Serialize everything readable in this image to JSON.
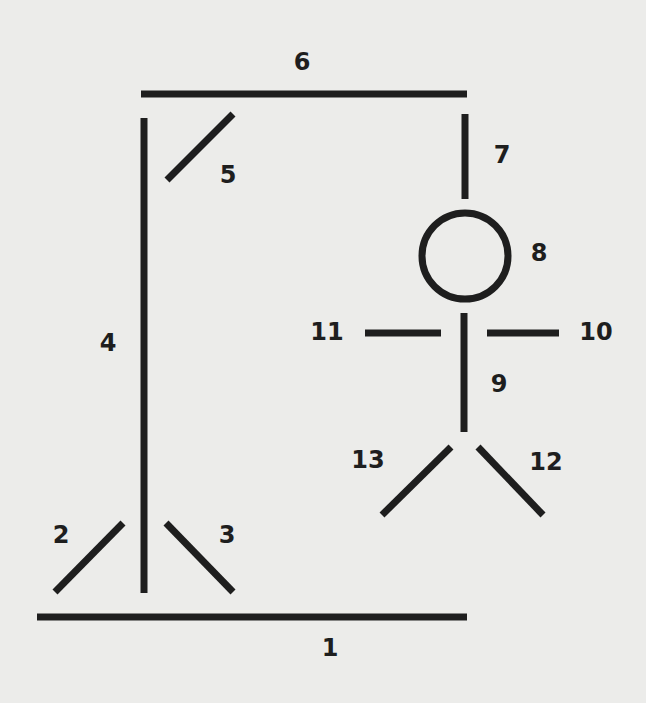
{
  "diagram": {
    "stroke_color": "#1e1e1e",
    "background_color": "#ececea",
    "parts": [
      {
        "id": 1,
        "name": "base",
        "label": "1",
        "shape": "line",
        "x1": 37,
        "y1": 617,
        "x2": 467,
        "y2": 617,
        "label_x": 330,
        "label_y": 648
      },
      {
        "id": 2,
        "name": "left-strut",
        "label": "2",
        "shape": "line",
        "x1": 123,
        "y1": 523,
        "x2": 55,
        "y2": 592,
        "label_x": 61,
        "label_y": 535
      },
      {
        "id": 3,
        "name": "right-strut",
        "label": "3",
        "shape": "line",
        "x1": 166,
        "y1": 523,
        "x2": 233,
        "y2": 592,
        "label_x": 227,
        "label_y": 535
      },
      {
        "id": 4,
        "name": "pole",
        "label": "4",
        "shape": "line",
        "x1": 144,
        "y1": 118,
        "x2": 144,
        "y2": 593,
        "label_x": 108,
        "label_y": 343
      },
      {
        "id": 5,
        "name": "brace",
        "label": "5",
        "shape": "line",
        "x1": 167,
        "y1": 180,
        "x2": 233,
        "y2": 114,
        "label_x": 228,
        "label_y": 175
      },
      {
        "id": 6,
        "name": "beam",
        "label": "6",
        "shape": "line",
        "x1": 141,
        "y1": 94,
        "x2": 467,
        "y2": 94,
        "label_x": 302,
        "label_y": 62
      },
      {
        "id": 7,
        "name": "rope",
        "label": "7",
        "shape": "line",
        "x1": 465,
        "y1": 114,
        "x2": 465,
        "y2": 199,
        "label_x": 502,
        "label_y": 155
      },
      {
        "id": 8,
        "name": "head",
        "label": "8",
        "shape": "circle",
        "cx": 465,
        "cy": 256,
        "r": 43,
        "label_x": 539,
        "label_y": 253
      },
      {
        "id": 9,
        "name": "body",
        "label": "9",
        "shape": "line",
        "x1": 464,
        "y1": 313,
        "x2": 464,
        "y2": 432,
        "label_x": 499,
        "label_y": 384
      },
      {
        "id": 10,
        "name": "right-arm",
        "label": "10",
        "shape": "line",
        "x1": 487,
        "y1": 333,
        "x2": 559,
        "y2": 333,
        "label_x": 596,
        "label_y": 332
      },
      {
        "id": 11,
        "name": "left-arm",
        "label": "11",
        "shape": "line",
        "x1": 365,
        "y1": 333,
        "x2": 441,
        "y2": 333,
        "label_x": 327,
        "label_y": 332
      },
      {
        "id": 12,
        "name": "right-leg",
        "label": "12",
        "shape": "line",
        "x1": 478,
        "y1": 447,
        "x2": 543,
        "y2": 515,
        "label_x": 546,
        "label_y": 462
      },
      {
        "id": 13,
        "name": "left-leg",
        "label": "13",
        "shape": "line",
        "x1": 451,
        "y1": 447,
        "x2": 382,
        "y2": 515,
        "label_x": 368,
        "label_y": 460
      }
    ]
  }
}
